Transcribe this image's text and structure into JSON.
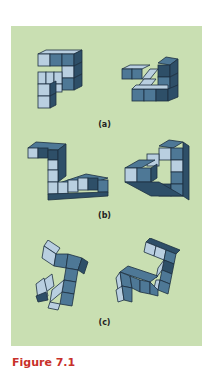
{
  "figure": {
    "caption": "Figure 7.1",
    "background_color": "#c9dfb2",
    "cube_colors": {
      "light": "#b9cfe0",
      "mid": "#4e7896",
      "dark": "#2e4f68",
      "edge": "#1c2f40"
    },
    "panels": [
      {
        "label": "(a)",
        "description": "Pair of 3D cube-block objects (mental rotation) — same object"
      },
      {
        "label": "(b)",
        "description": "Pair of 3D cube-block objects (mental rotation) — same object"
      },
      {
        "label": "(c)",
        "description": "Pair of 3D cube-block objects (mental rotation) — different objects"
      }
    ]
  }
}
